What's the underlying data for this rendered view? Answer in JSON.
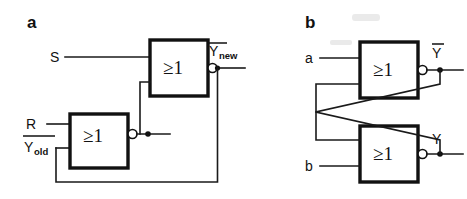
{
  "figure": {
    "type": "logic-circuit-diagram",
    "background_color": "#ffffff",
    "line_color": "#1a1a1a"
  },
  "panels": [
    {
      "id": "a",
      "letter": "a",
      "gates": [
        {
          "id": "a-gate-top",
          "symbol": "≥1",
          "inverted_output": true,
          "inputs": [
            "S",
            "feedback-from-lower-gate"
          ],
          "output": "Ynew-bar"
        },
        {
          "id": "a-gate-bottom",
          "symbol": "≥1",
          "inverted_output": true,
          "inputs": [
            "R",
            "Yold-bar"
          ],
          "output": "feedback-to-upper-gate"
        }
      ],
      "labels": [
        {
          "id": "a-input-s",
          "text": "S",
          "overbar": false,
          "subscript": ""
        },
        {
          "id": "a-input-r",
          "text": "R",
          "overbar": false,
          "subscript": ""
        },
        {
          "id": "a-input-yold",
          "text": "Y",
          "overbar": true,
          "subscript": "old"
        },
        {
          "id": "a-output-ynew",
          "text": "Y",
          "overbar": true,
          "subscript": "new"
        }
      ]
    },
    {
      "id": "b",
      "letter": "b",
      "gates": [
        {
          "id": "b-gate-top",
          "symbol": "≥1",
          "inverted_output": true,
          "inputs": [
            "a",
            "cross-coupled-from-bottom"
          ],
          "output": "Y-bar"
        },
        {
          "id": "b-gate-bottom",
          "symbol": "≥1",
          "inverted_output": true,
          "inputs": [
            "b",
            "cross-coupled-from-top"
          ],
          "output": "Y"
        }
      ],
      "labels": [
        {
          "id": "b-input-a",
          "text": "a",
          "overbar": false,
          "subscript": ""
        },
        {
          "id": "b-input-b",
          "text": "b",
          "overbar": false,
          "subscript": ""
        },
        {
          "id": "b-output-yb",
          "text": "Y",
          "overbar": true,
          "subscript": ""
        },
        {
          "id": "b-output-y",
          "text": "Y",
          "overbar": false,
          "subscript": ""
        }
      ]
    }
  ],
  "text": {
    "panel_a_letter": "a",
    "panel_b_letter": "b",
    "gate_symbol": "≥1",
    "label_s": "S",
    "label_r": "R",
    "label_y": "Y",
    "sub_old": "old",
    "sub_new": "new",
    "label_a": "a",
    "label_b": "b"
  }
}
